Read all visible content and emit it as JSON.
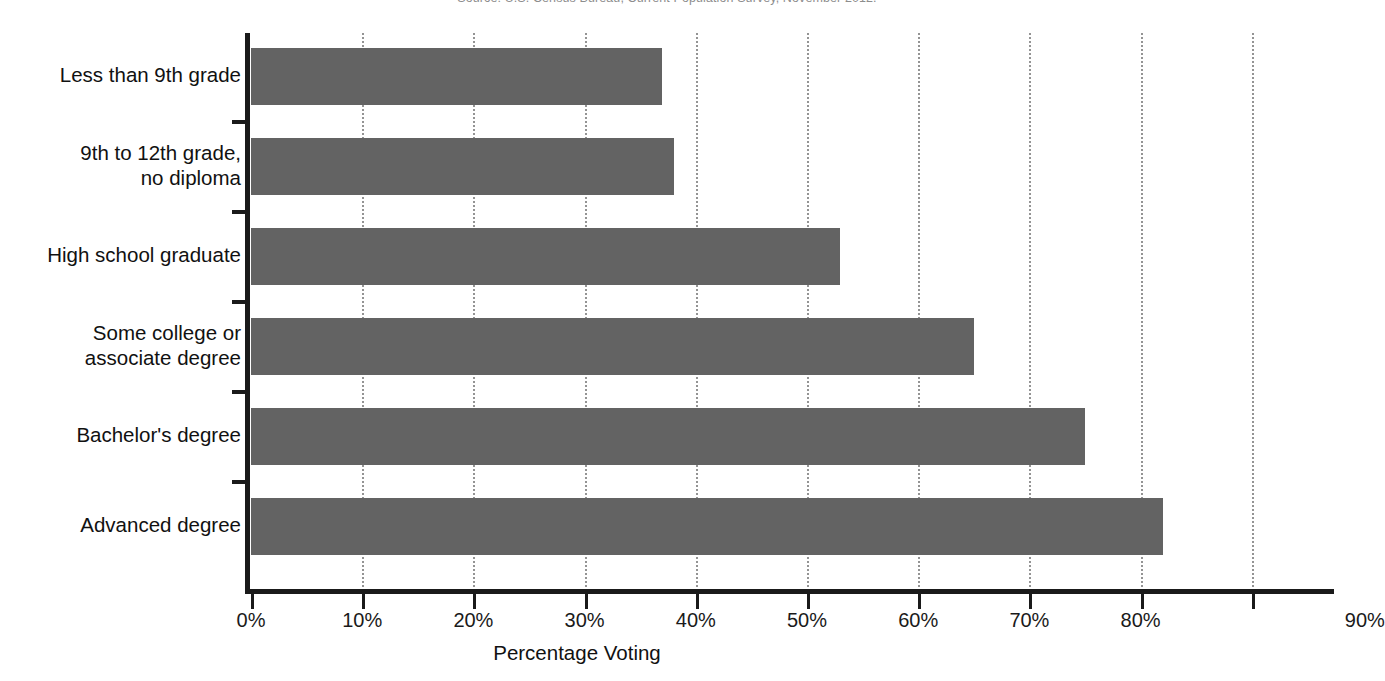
{
  "source_note": "Source: U.S. Census Bureau, Current Population Survey, November 2012.",
  "axis_title": "Percentage Voting",
  "colors": {
    "bar": "#636363",
    "axis": "#1a1a1a",
    "grid": "#949494",
    "background": "#ffffff"
  },
  "chart_data": {
    "type": "bar",
    "orientation": "horizontal",
    "title": "",
    "xlabel": "Percentage Voting",
    "ylabel": "",
    "xlim": [
      0,
      96
    ],
    "xticks": [
      0,
      10,
      20,
      30,
      40,
      50,
      60,
      70,
      80,
      90
    ],
    "xtick_labels": [
      "0%",
      "10%",
      "20%",
      "30%",
      "40%",
      "50%",
      "60%",
      "70%",
      "80%",
      "90%"
    ],
    "grid": "vertical-dotted",
    "legend": "none",
    "categories": [
      "Less than 9th grade",
      "9th to 12th grade,\nno diploma",
      "High school graduate",
      "Some college or\nassociate degree",
      "Bachelor's degree",
      "Advanced degree"
    ],
    "values": [
      37,
      38,
      53,
      65,
      75,
      82
    ],
    "value_labels": [
      "37%",
      "38%",
      "53%",
      "65%",
      "75%",
      "82%"
    ]
  }
}
